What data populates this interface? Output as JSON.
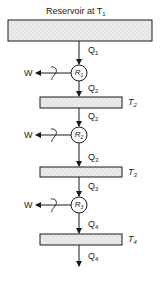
{
  "diagram": {
    "title": {
      "text": "Reservoir at T",
      "sub": "1"
    },
    "reservoirs": [
      {
        "id": "T1",
        "label": "T",
        "sub": "1"
      },
      {
        "id": "T2",
        "label": "T",
        "sub": "2"
      },
      {
        "id": "T3",
        "label": "T",
        "sub": "3"
      },
      {
        "id": "T4",
        "label": "T",
        "sub": "4"
      }
    ],
    "engines": [
      {
        "id": "R1",
        "label": "R",
        "sub": "1",
        "work": "W"
      },
      {
        "id": "R2",
        "label": "R",
        "sub": "2",
        "work": "W"
      },
      {
        "id": "R3",
        "label": "R",
        "sub": "3",
        "work": "W"
      }
    ],
    "heat_flows": [
      {
        "label": "Q",
        "sub": "1"
      },
      {
        "label": "Q",
        "sub": "2"
      },
      {
        "label": "Q",
        "sub": "2"
      },
      {
        "label": "Q",
        "sub": "3"
      },
      {
        "label": "Q",
        "sub": "3"
      },
      {
        "label": "Q",
        "sub": "4"
      },
      {
        "label": "Q",
        "sub": "4"
      }
    ],
    "colors": {
      "line": "#1a1a1a",
      "fill": "#e6e6e6"
    }
  }
}
